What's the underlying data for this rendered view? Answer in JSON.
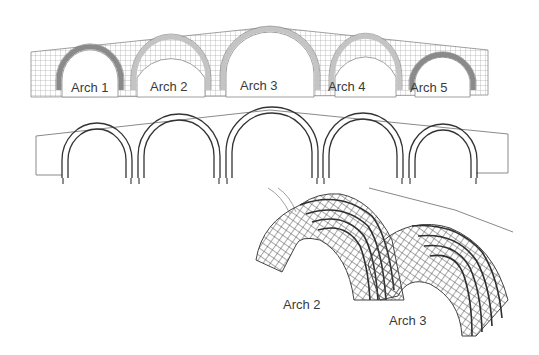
{
  "figure": {
    "panels": [
      {
        "id": "mesh-2d",
        "description": "2D finite element mesh of five-arch bridge elevation",
        "labels": [
          "Arch 1",
          "Arch 2",
          "Arch 3",
          "Arch 4",
          "Arch 5"
        ]
      },
      {
        "id": "frame-2d",
        "description": "2D frame model of five arch rings within outline"
      },
      {
        "id": "frame-3d",
        "description": "3D space-frame model of two arch barrels",
        "labels": [
          "Arch 2",
          "Arch 3"
        ]
      }
    ],
    "colors": {
      "mesh_line": "#8a8a8a",
      "ring_fill": "#9a9a9a",
      "frame_line": "#3a3a3a",
      "outline": "#8a8a8a",
      "text": "#3a3a3a"
    }
  }
}
